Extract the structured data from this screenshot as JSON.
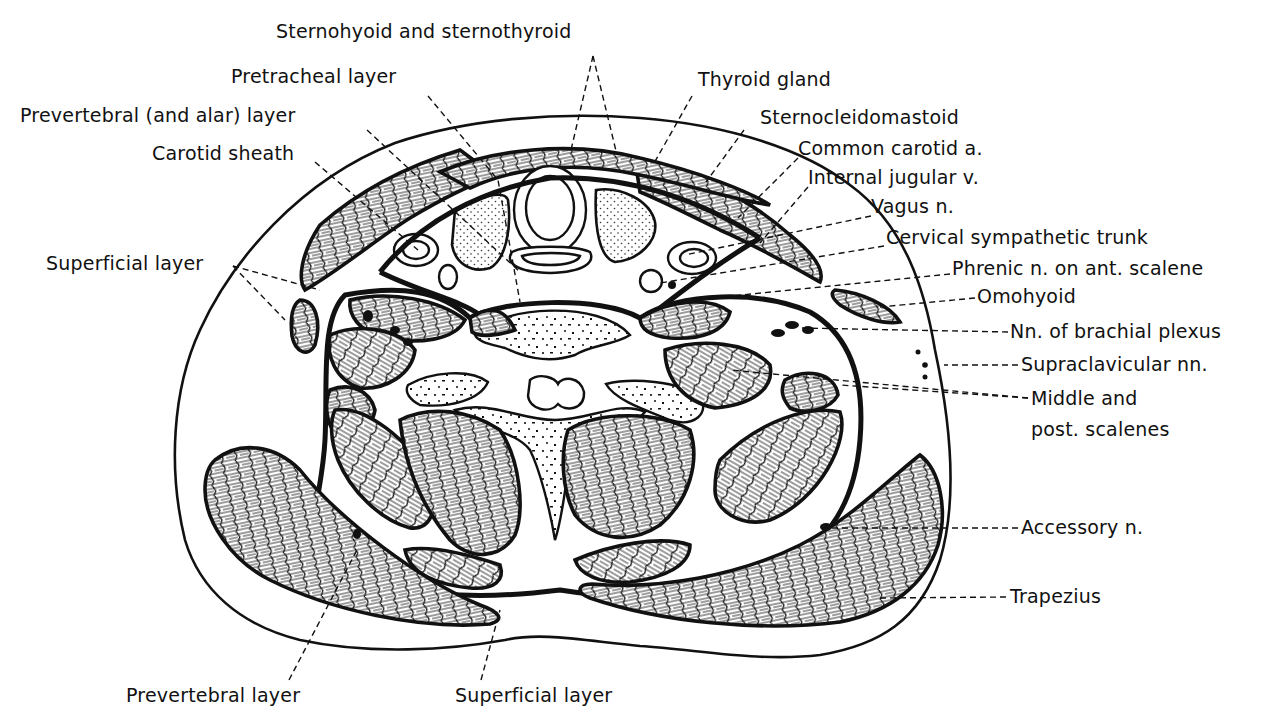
{
  "figure": {
    "type": "anatomical-cross-section",
    "colors": {
      "ink": "#111111",
      "background": "#ffffff"
    }
  },
  "labels": {
    "top": [
      {
        "id": "sternohyoid_sternothyroid",
        "text": "Sternohyoid and sternothyroid",
        "x": 276,
        "y": 38
      },
      {
        "id": "pretracheal_layer",
        "text": "Pretracheal layer",
        "x": 231,
        "y": 83
      },
      {
        "id": "prevertebral_alar_layer",
        "text": "Prevertebral (and alar) layer",
        "x": 20,
        "y": 122
      },
      {
        "id": "carotid_sheath",
        "text": "Carotid sheath",
        "x": 152,
        "y": 160
      },
      {
        "id": "thyroid_gland",
        "text": "Thyroid gland",
        "x": 698,
        "y": 86
      }
    ],
    "right": [
      {
        "id": "sternocleidomastoid",
        "text": "Sternocleidomastoid",
        "x": 760,
        "y": 124
      },
      {
        "id": "common_carotid",
        "text": "Common carotid a.",
        "x": 798,
        "y": 155
      },
      {
        "id": "internal_jugular",
        "text": "Internal jugular v.",
        "x": 808,
        "y": 184
      },
      {
        "id": "vagus",
        "text": "Vagus n.",
        "x": 871,
        "y": 213
      },
      {
        "id": "cervical_sympathetic_trunk",
        "text": "Cervical sympathetic trunk",
        "x": 886,
        "y": 244
      },
      {
        "id": "phrenic",
        "text": "Phrenic n. on ant. scalene",
        "x": 952,
        "y": 275
      },
      {
        "id": "omohyoid",
        "text": "Omohyoid",
        "x": 977,
        "y": 303
      },
      {
        "id": "brachial_plexus",
        "text": "Nn. of brachial plexus",
        "x": 1010,
        "y": 338
      },
      {
        "id": "supraclavicular",
        "text": "Supraclavicular nn.",
        "x": 1021,
        "y": 371
      },
      {
        "id": "middle_scalenes",
        "text": "Middle and",
        "x": 1031,
        "y": 405
      },
      {
        "id": "post_scalenes",
        "text": "post. scalenes",
        "x": 1031,
        "y": 436
      },
      {
        "id": "accessory",
        "text": "Accessory n.",
        "x": 1021,
        "y": 534
      },
      {
        "id": "trapezius",
        "text": "Trapezius",
        "x": 1010,
        "y": 603
      }
    ],
    "left": [
      {
        "id": "superficial_layer_left",
        "text": "Superficial layer",
        "x": 46,
        "y": 270
      }
    ],
    "bottom": [
      {
        "id": "prevertebral_layer",
        "text": "Prevertebral layer",
        "x": 126,
        "y": 702
      },
      {
        "id": "superficial_layer_bottom",
        "text": "Superficial layer",
        "x": 455,
        "y": 702
      }
    ]
  },
  "leaders": [
    {
      "for": "sternohyoid_sternothyroid",
      "points": [
        [
          593,
          56
        ],
        [
          571,
          150
        ]
      ]
    },
    {
      "for": "sternohyoid_sternothyroid",
      "points": [
        [
          593,
          56
        ],
        [
          617,
          155
        ]
      ]
    },
    {
      "for": "pretracheal_layer",
      "points": [
        [
          428,
          96
        ],
        [
          498,
          180
        ],
        [
          520,
          302
        ]
      ]
    },
    {
      "for": "prevertebral_alar_layer",
      "points": [
        [
          367,
          130
        ],
        [
          520,
          272
        ]
      ]
    },
    {
      "for": "carotid_sheath",
      "points": [
        [
          315,
          162
        ],
        [
          418,
          250
        ]
      ]
    },
    {
      "for": "thyroid_gland",
      "points": [
        [
          692,
          96
        ],
        [
          653,
          165
        ]
      ]
    },
    {
      "for": "sternocleidomastoid",
      "points": [
        [
          744,
          130
        ],
        [
          706,
          182
        ]
      ]
    },
    {
      "for": "common_carotid",
      "points": [
        [
          798,
          158
        ],
        [
          738,
          218
        ]
      ]
    },
    {
      "for": "internal_jugular",
      "points": [
        [
          808,
          187
        ],
        [
          760,
          243
        ]
      ]
    },
    {
      "for": "vagus",
      "points": [
        [
          871,
          216
        ],
        [
          685,
          255
        ]
      ]
    },
    {
      "for": "cervical_sympathetic_trunk",
      "points": [
        [
          884,
          246
        ],
        [
          660,
          283
        ]
      ]
    },
    {
      "for": "phrenic",
      "points": [
        [
          950,
          274
        ],
        [
          692,
          300
        ]
      ]
    },
    {
      "for": "omohyoid",
      "points": [
        [
          975,
          298
        ],
        [
          880,
          307
        ]
      ]
    },
    {
      "for": "brachial_plexus",
      "points": [
        [
          1008,
          332
        ],
        [
          800,
          328
        ]
      ]
    },
    {
      "for": "supraclavicular",
      "points": [
        [
          1018,
          365
        ],
        [
          944,
          365
        ]
      ]
    },
    {
      "for": "middle_scalenes",
      "points": [
        [
          1028,
          398
        ],
        [
          730,
          370
        ]
      ]
    },
    {
      "for": "middle_scalenes",
      "points": [
        [
          1028,
          398
        ],
        [
          840,
          385
        ]
      ]
    },
    {
      "for": "accessory",
      "points": [
        [
          1018,
          528
        ],
        [
          826,
          528
        ]
      ]
    },
    {
      "for": "trapezius",
      "points": [
        [
          1006,
          597
        ],
        [
          880,
          598
        ]
      ]
    },
    {
      "for": "superficial_layer_left",
      "points": [
        [
          233,
          266
        ],
        [
          320,
          290
        ]
      ]
    },
    {
      "for": "superficial_layer_left",
      "points": [
        [
          233,
          266
        ],
        [
          285,
          320
        ]
      ]
    },
    {
      "for": "prevertebral_layer",
      "points": [
        [
          289,
          680
        ],
        [
          358,
          548
        ]
      ]
    },
    {
      "for": "superficial_layer_bottom",
      "points": [
        [
          481,
          680
        ],
        [
          500,
          610
        ]
      ]
    }
  ]
}
